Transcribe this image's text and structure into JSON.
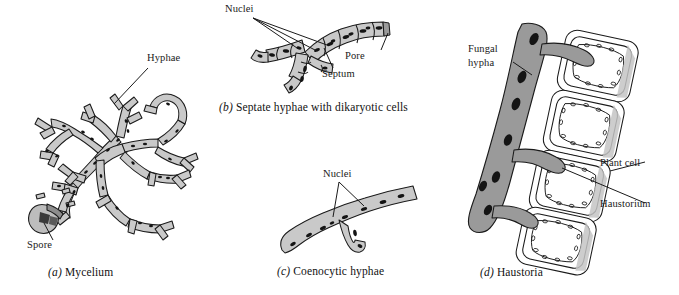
{
  "figure": {
    "background_color": "#ffffff",
    "ink_color": "#1a1a1a",
    "hypha_fill": "#c9c9c9",
    "hypha_fill_dark": "#9a9a9a",
    "plant_cell_fill": "#ffffff",
    "plant_cell_shade": "#b9b9b9",
    "nucleus_color": "#141414"
  },
  "panels": [
    {
      "id": "a",
      "caption_mark": "(a)",
      "caption_text": "Mycelium",
      "labels": [
        {
          "name": "hyphae",
          "text": "Hyphae"
        },
        {
          "name": "spore",
          "text": "Spore"
        }
      ]
    },
    {
      "id": "b",
      "caption_mark": "(b)",
      "caption_text": "Septate hyphae with dikaryotic cells",
      "labels": [
        {
          "name": "nuclei",
          "text": "Nuclei"
        },
        {
          "name": "pore",
          "text": "Pore"
        },
        {
          "name": "septum",
          "text": "Septum"
        }
      ]
    },
    {
      "id": "c",
      "caption_mark": "(c)",
      "caption_text": "Coenocytic hyphae",
      "labels": [
        {
          "name": "nuclei",
          "text": "Nuclei"
        }
      ]
    },
    {
      "id": "d",
      "caption_mark": "(d)",
      "caption_text": "Haustoria",
      "labels": [
        {
          "name": "fungal-hypha-line1",
          "text": "Fungal"
        },
        {
          "name": "fungal-hypha-line2",
          "text": "hypha"
        },
        {
          "name": "plant-cell",
          "text": "Plant cell"
        },
        {
          "name": "haustorium",
          "text": "Haustorium"
        }
      ]
    }
  ]
}
